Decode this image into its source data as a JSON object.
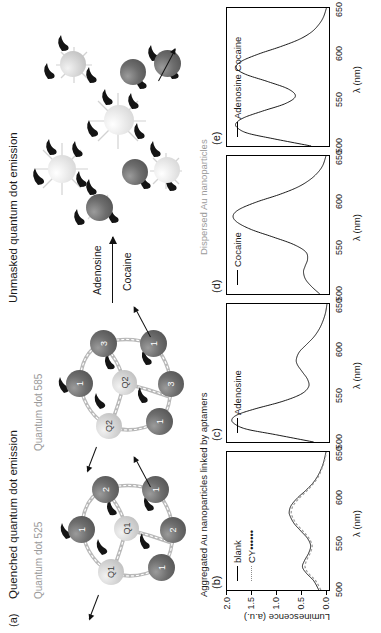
{
  "figure": {
    "panel_a": {
      "tag": "(a)",
      "state_left_title": "Quenched quantum dot emission",
      "state_right_title": "Unmasked quantum dot emission",
      "qd_label_525": "Quantum dot 525",
      "qd_label_585": "Quantum dot 585",
      "arrow_label_top": "Adenosine",
      "arrow_label_bottom": "Cocaine",
      "cluster_left": {
        "particles": [
          {
            "label": "Q1",
            "kind": "qd"
          },
          {
            "label": "Q1",
            "kind": "qd"
          },
          {
            "label": "1",
            "kind": "dark"
          },
          {
            "label": "1",
            "kind": "dark"
          },
          {
            "label": "1",
            "kind": "dark"
          },
          {
            "label": "2",
            "kind": "dark"
          },
          {
            "label": "2",
            "kind": "dark"
          }
        ]
      },
      "cluster_right": {
        "particles": [
          {
            "label": "Q2",
            "kind": "qd"
          },
          {
            "label": "Q2",
            "kind": "qd"
          },
          {
            "label": "1",
            "kind": "dark"
          },
          {
            "label": "1",
            "kind": "dark"
          },
          {
            "label": "1",
            "kind": "dark"
          },
          {
            "label": "3",
            "kind": "dark"
          },
          {
            "label": "3",
            "kind": "dark"
          }
        ]
      }
    },
    "group_labels": {
      "aggregated": "Aggregated Au nanoparticles linked by aptamers",
      "dispersed": "Dispersed Au nanoparticles"
    },
    "axes": {
      "xlabel": "λ (nm)",
      "ylabel": "Luminescence (a.u.)",
      "xticks": [
        "500",
        "550",
        "600",
        "650"
      ],
      "yticks": [
        "0.0",
        "0.5",
        "1.0",
        "1.5",
        "2.0"
      ]
    }
  },
  "chart_data": [
    {
      "type": "line",
      "panel": "(b)",
      "title": "",
      "xlabel": "λ (nm)",
      "ylabel": "Luminescence (a.u.)",
      "xlim": [
        500,
        650
      ],
      "ylim": [
        0.0,
        2.0
      ],
      "xticks": [
        500,
        550,
        600,
        650
      ],
      "yticks": [
        0.0,
        0.5,
        1.0,
        1.5,
        2.0
      ],
      "legend_position": "top-left",
      "grid": false,
      "series": [
        {
          "name": "blank",
          "style": "solid",
          "x": [
            500,
            510,
            518,
            525,
            532,
            540,
            548,
            556,
            564,
            572,
            580,
            585,
            592,
            600,
            608,
            616,
            624,
            632,
            640,
            650
          ],
          "y": [
            0.2,
            0.3,
            0.44,
            0.52,
            0.48,
            0.4,
            0.36,
            0.42,
            0.55,
            0.68,
            0.76,
            0.78,
            0.74,
            0.62,
            0.46,
            0.32,
            0.22,
            0.15,
            0.1,
            0.06
          ]
        },
        {
          "name": "CY••••••",
          "style": "dotted",
          "x": [
            500,
            510,
            518,
            525,
            532,
            540,
            548,
            556,
            564,
            572,
            580,
            585,
            592,
            600,
            608,
            616,
            624,
            632,
            640,
            650
          ],
          "y": [
            0.16,
            0.26,
            0.4,
            0.47,
            0.44,
            0.37,
            0.33,
            0.39,
            0.51,
            0.64,
            0.72,
            0.74,
            0.7,
            0.58,
            0.43,
            0.3,
            0.2,
            0.14,
            0.09,
            0.05
          ]
        }
      ]
    },
    {
      "type": "line",
      "panel": "(c)",
      "title": "",
      "xlabel": "λ (nm)",
      "ylabel": "",
      "xlim": [
        500,
        650
      ],
      "ylim": [
        0.0,
        2.0
      ],
      "xticks": [
        550,
        600,
        650
      ],
      "yticks": [],
      "legend_position": "top-left",
      "grid": false,
      "series": [
        {
          "name": "Adenosine",
          "style": "solid",
          "x": [
            500,
            508,
            514,
            520,
            525,
            530,
            536,
            544,
            552,
            560,
            568,
            576,
            584,
            590,
            598,
            606,
            614,
            622,
            630,
            640,
            650
          ],
          "y": [
            0.3,
            1.05,
            1.62,
            1.86,
            1.9,
            1.78,
            1.45,
            0.92,
            0.55,
            0.4,
            0.42,
            0.52,
            0.62,
            0.64,
            0.58,
            0.44,
            0.3,
            0.2,
            0.13,
            0.07,
            0.04
          ]
        }
      ]
    },
    {
      "type": "line",
      "panel": "(d)",
      "title": "",
      "xlabel": "λ (nm)",
      "ylabel": "",
      "xlim": [
        500,
        650
      ],
      "ylim": [
        0.0,
        2.0
      ],
      "xticks": [
        550,
        600,
        650
      ],
      "yticks": [],
      "legend_position": "top-left",
      "grid": false,
      "series": [
        {
          "name": "Cocaine",
          "style": "solid",
          "x": [
            500,
            508,
            516,
            524,
            530,
            538,
            546,
            554,
            562,
            570,
            578,
            585,
            592,
            600,
            608,
            616,
            624,
            632,
            640,
            650
          ],
          "y": [
            0.18,
            0.34,
            0.46,
            0.5,
            0.47,
            0.42,
            0.46,
            0.7,
            1.1,
            1.52,
            1.8,
            1.88,
            1.76,
            1.42,
            0.98,
            0.62,
            0.38,
            0.22,
            0.12,
            0.06
          ]
        }
      ]
    },
    {
      "type": "line",
      "panel": "(e)",
      "title": "",
      "xlabel": "λ (nm)",
      "ylabel": "",
      "xlim": [
        500,
        650
      ],
      "ylim": [
        0.0,
        2.0
      ],
      "xticks": [
        550,
        600,
        650
      ],
      "yticks": [],
      "legend_position": "top-left",
      "grid": false,
      "series": [
        {
          "name": "Adenosine Cocaine",
          "style": "solid",
          "x": [
            500,
            508,
            514,
            520,
            525,
            531,
            538,
            546,
            554,
            562,
            570,
            578,
            585,
            592,
            600,
            608,
            616,
            624,
            632,
            640,
            650
          ],
          "y": [
            0.35,
            1.1,
            1.6,
            1.8,
            1.82,
            1.66,
            1.3,
            0.86,
            0.66,
            0.8,
            1.2,
            1.64,
            1.82,
            1.72,
            1.38,
            0.95,
            0.58,
            0.34,
            0.2,
            0.11,
            0.05
          ]
        }
      ]
    }
  ]
}
